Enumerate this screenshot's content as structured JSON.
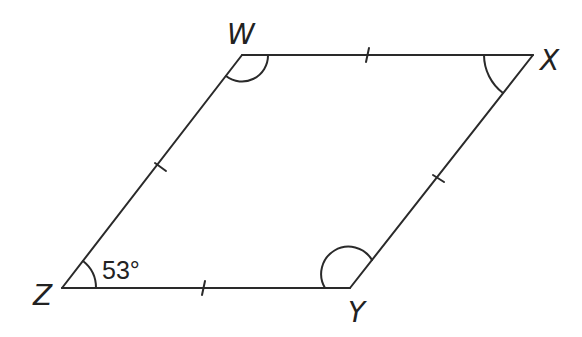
{
  "figure": {
    "shape": "rhombus",
    "stroke_color": "#2a2a2a",
    "vertices": [
      {
        "label": "W",
        "x": 242,
        "y": 55
      },
      {
        "label": "X",
        "x": 533,
        "y": 55
      },
      {
        "label": "Y",
        "x": 350,
        "y": 288
      },
      {
        "label": "Z",
        "x": 62,
        "y": 288
      }
    ],
    "sides": [
      "WX",
      "XY",
      "YZ",
      "ZW"
    ],
    "tick_marks_per_side": 1,
    "angle_marks": [
      "W",
      "X",
      "Y",
      "Z"
    ],
    "given_angle": {
      "vertex": "Z",
      "text": "53°"
    }
  }
}
